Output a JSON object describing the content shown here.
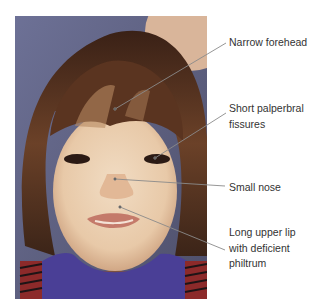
{
  "figure": {
    "annotations": [
      {
        "id": "forehead",
        "lines": [
          "Narrow forehead"
        ],
        "label_top": 35,
        "target": [
          115,
          109
        ],
        "anchor": [
          226,
          43
        ]
      },
      {
        "id": "eyes",
        "lines": [
          "Short palperbral",
          "fissures"
        ],
        "label_top": 101,
        "target": [
          155,
          158
        ],
        "anchor": [
          226,
          113
        ]
      },
      {
        "id": "nose",
        "lines": [
          "Small nose"
        ],
        "label_top": 180,
        "target": [
          115,
          179
        ],
        "anchor": [
          225,
          186
        ]
      },
      {
        "id": "lip",
        "lines": [
          "Long upper lip",
          "with deficient",
          "philtrum"
        ],
        "label_top": 225,
        "target": [
          120,
          207
        ],
        "anchor": [
          225,
          250
        ]
      }
    ],
    "colors": {
      "leader_line": "#8a8a8a",
      "label_text": "#333333",
      "background": "#ffffff"
    }
  }
}
